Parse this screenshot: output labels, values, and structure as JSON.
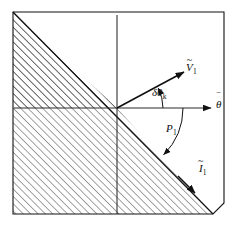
{
  "figure": {
    "background_color": "#ffffff",
    "line_color": "#1a1a1a",
    "hatch_color": "#333333",
    "frame": {
      "left": 13,
      "top": 12,
      "right": 224,
      "bottom": 214,
      "corner_cut": "bottom-right 45 degree chamfer"
    },
    "axes": {
      "origin_x": 117,
      "origin_y": 108,
      "horizontal_label": "θ",
      "horizontal_accent": "‾",
      "vertical_label": "",
      "horizontal_arrow": true
    },
    "labels": {
      "v_vector": {
        "base": "V",
        "accent": "~",
        "subscript": "1",
        "text": "Ṽ₁"
      },
      "i_vector": {
        "base": "I",
        "accent": "~",
        "subscript": "1",
        "text": "Ĩ₁"
      },
      "theta_axis": {
        "base": "θ",
        "accent": "‾",
        "subscript": "",
        "text": "θ̄"
      },
      "delta_theta": {
        "base": "δθ",
        "accent": "",
        "subscript": "k",
        "text": "δθₖ"
      },
      "power_angle": {
        "base": "P",
        "accent": "",
        "subscript": "1",
        "text": "P₁"
      }
    },
    "vectors": [
      {
        "name": "v-vector",
        "label": "Ṽ₁",
        "angle_deg": 28,
        "length_px": 72,
        "direction": "up-right"
      },
      {
        "name": "i-vector",
        "label": "Ĩ₁",
        "angle_deg": -45,
        "length_px": 105,
        "direction": "down-right"
      }
    ],
    "arcs": [
      {
        "name": "delta-theta-arc",
        "label": "δθₖ",
        "from_deg": 0,
        "to_deg": 28,
        "radius_px": 46
      },
      {
        "name": "power-angle-arc",
        "label": "P₁",
        "from_deg": 0,
        "to_deg": -45,
        "radius_px": 66
      }
    ],
    "region": {
      "name": "hatched-region",
      "hatch_angle_deg": 45,
      "hatch_spacing_px": 4,
      "description": "Region to the left of and below the diagonal boundary line"
    }
  }
}
